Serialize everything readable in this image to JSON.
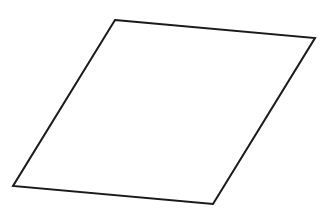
{
  "diagram": {
    "shape": "parallelogram",
    "stroke_color": "#1a1a1a",
    "fill_color": "#ffffff",
    "stroke_width": 2,
    "vertices": [
      {
        "x": 115,
        "y": 20
      },
      {
        "x": 315,
        "y": 38
      },
      {
        "x": 213,
        "y": 204
      },
      {
        "x": 13,
        "y": 186
      }
    ]
  }
}
